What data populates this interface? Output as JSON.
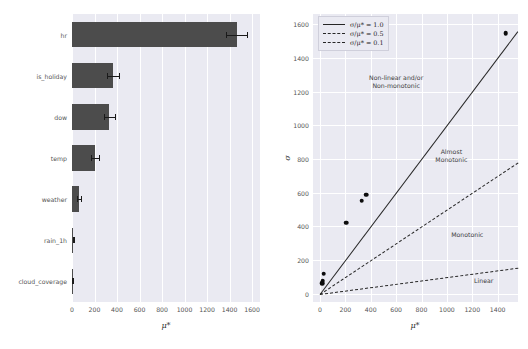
{
  "figure": {
    "title": "",
    "background": "#ffffff",
    "panel_background": "#eaeaf2",
    "grid_color": "#ffffff",
    "bar_color": "#4c4c4c",
    "point_color": "#0d0d0d",
    "line_color": "#262626"
  },
  "chart_data": [
    {
      "type": "bar",
      "orientation": "horizontal",
      "title": "",
      "xlabel": "μ*",
      "ylabel": "",
      "xlim": [
        0,
        1670
      ],
      "xticks": [
        0,
        200,
        400,
        600,
        800,
        1000,
        1200,
        1400,
        1600
      ],
      "xticklabels": [
        "0",
        "200",
        "400",
        "600",
        "800",
        "1000",
        "1200",
        "1400",
        "1600"
      ],
      "grid": true,
      "categories": [
        "hr",
        "is_holiday",
        "dow",
        "temp",
        "weather",
        "rain_1h",
        "cloud_coverage"
      ],
      "values": [
        1462,
        366,
        330,
        205,
        62,
        11,
        3
      ],
      "errors": [
        95,
        55,
        50,
        38,
        16,
        5,
        2
      ],
      "errorbar_style": "horizontal-caps"
    },
    {
      "type": "scatter",
      "title": "",
      "xlabel": "μ*",
      "ylabel": "σ",
      "xlim": [
        -55,
        1560
      ],
      "ylim": [
        -48,
        1660
      ],
      "xticks": [
        0,
        200,
        400,
        600,
        800,
        1000,
        1200,
        1400
      ],
      "xticklabels": [
        "0",
        "200",
        "400",
        "600",
        "800",
        "1000",
        "1200",
        "1400"
      ],
      "yticks": [
        0,
        200,
        400,
        600,
        800,
        1000,
        1200,
        1400,
        1600
      ],
      "yticklabels": [
        "0",
        "200",
        "400",
        "600",
        "800",
        "1000",
        "1200",
        "1400",
        "1600"
      ],
      "grid": true,
      "points": [
        {
          "label": "hr",
          "x": 1462,
          "y": 1545
        },
        {
          "label": "is_holiday",
          "x": 366,
          "y": 588
        },
        {
          "label": "dow",
          "x": 330,
          "y": 552
        },
        {
          "label": "temp",
          "x": 205,
          "y": 423
        },
        {
          "label": "weather",
          "x": 30,
          "y": 120
        },
        {
          "label": "rain_1h",
          "x": 22,
          "y": 78
        },
        {
          "label": "cloud_coverage",
          "x": 18,
          "y": 62
        }
      ],
      "reference_lines": [
        {
          "label": "σ/μ* = 1.0",
          "slope": 1.0,
          "style": "solid"
        },
        {
          "label": "σ/μ* = 0.5",
          "slope": 0.5,
          "style": "dashed"
        },
        {
          "label": "σ/μ* = 0.1",
          "slope": 0.1,
          "style": "dashdot"
        }
      ],
      "annotations": [
        {
          "name": "non-linear-region",
          "text": "Non-linear and/or\nNon-monotonic",
          "x": 600,
          "y": 1255
        },
        {
          "name": "almost-monotonic-region",
          "text": "Almost\nMonotonic",
          "x": 1035,
          "y": 815
        },
        {
          "name": "monotonic-region",
          "text": "Monotonic",
          "x": 1160,
          "y": 350
        },
        {
          "name": "linear-region",
          "text": "Linear",
          "x": 1290,
          "y": 75
        }
      ],
      "legend_position": "upper left"
    }
  ],
  "left_panel": {
    "name": "morris-mu-star-bar-chart",
    "xlabel": "μ*",
    "xticklabels": [
      "0",
      "200",
      "400",
      "600",
      "800",
      "1000",
      "1200",
      "1400",
      "1600"
    ],
    "yticklabels": [
      "hr",
      "is_holiday",
      "dow",
      "temp",
      "weather",
      "rain_1h",
      "cloud_coverage"
    ]
  },
  "right_panel": {
    "name": "morris-mu-star-vs-sigma-scatter",
    "xlabel": "μ*",
    "ylabel": "σ",
    "xticklabels": [
      "0",
      "200",
      "400",
      "600",
      "800",
      "1000",
      "1200",
      "1400"
    ],
    "yticklabels": [
      "0",
      "200",
      "400",
      "600",
      "800",
      "1000",
      "1200",
      "1400",
      "1600"
    ],
    "legend": [
      {
        "label": "σ/μ* = 1.0",
        "style": "solid"
      },
      {
        "label": "σ/μ* = 0.5",
        "style": "dashed"
      },
      {
        "label": "σ/μ* = 0.1",
        "style": "dashdot"
      }
    ],
    "annotations": {
      "non_linear": "Non-linear and/or\nNon-monotonic",
      "almost_monotonic": "Almost\nMonotonic",
      "monotonic": "Monotonic",
      "linear": "Linear"
    }
  }
}
